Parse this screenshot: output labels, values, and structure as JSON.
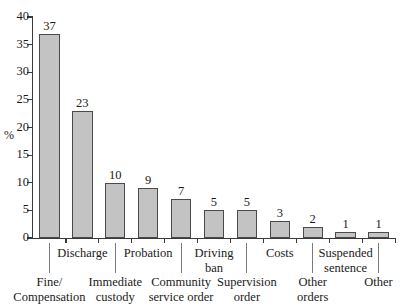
{
  "chart_data": {
    "type": "bar",
    "title": "",
    "xlabel": "",
    "ylabel": "%",
    "ylim": [
      0,
      40
    ],
    "ytick_step": 5,
    "grid": false,
    "legend": "none",
    "bar_fill_color": "#c3c3c3",
    "bar_edge_color": "#4a4a4a",
    "axis_color": "#3a3a3a",
    "categories": [
      "Fine/\nCompensation",
      "Discharge",
      "Immediate\ncustody",
      "Probation",
      "Community\nservice order",
      "Driving\nban",
      "Supervision\norder",
      "Costs",
      "Other\norders",
      "Suspended\nsentence",
      "Other"
    ],
    "values": [
      37,
      23,
      10,
      9,
      7,
      5,
      5,
      3,
      2,
      1,
      1
    ],
    "yticks": [
      "0",
      "5",
      "10",
      "15",
      "20",
      "25",
      "30",
      "35",
      "40"
    ],
    "ytick_values": [
      0,
      5,
      10,
      15,
      20,
      25,
      30,
      35,
      40
    ],
    "value_labels": [
      "37",
      "23",
      "10",
      "9",
      "7",
      "5",
      "5",
      "3",
      "2",
      "1",
      "1"
    ],
    "axis_unit_label": "%"
  },
  "labels": {
    "upper_row": [
      {
        "index": 1,
        "line1": "Discharge",
        "line2": ""
      },
      {
        "index": 3,
        "line1": "Probation",
        "line2": ""
      },
      {
        "index": 5,
        "line1": "Driving",
        "line2": "ban"
      },
      {
        "index": 7,
        "line1": "Costs",
        "line2": ""
      },
      {
        "index": 9,
        "line1": "Suspended",
        "line2": "sentence"
      }
    ],
    "lower_row": [
      {
        "index": 0,
        "line1": "Fine/",
        "line2": "Compensation"
      },
      {
        "index": 2,
        "line1": "Immediate",
        "line2": "custody"
      },
      {
        "index": 4,
        "line1": "Community",
        "line2": "service order"
      },
      {
        "index": 6,
        "line1": "Supervision",
        "line2": "order"
      },
      {
        "index": 8,
        "line1": "Other",
        "line2": "orders"
      },
      {
        "index": 10,
        "line1": "Other",
        "line2": ""
      }
    ]
  }
}
